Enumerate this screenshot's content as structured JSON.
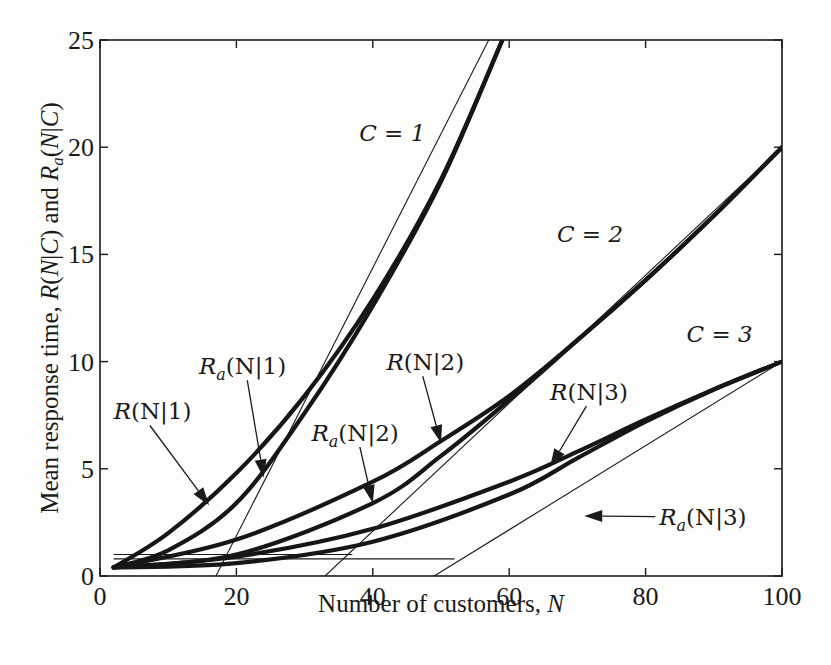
{
  "chart_data": {
    "type": "line",
    "title": "",
    "xlabel": "Number of customers, N",
    "ylabel": "Mean response time, R(N|C) and R_a(N|C)",
    "xlim": [
      0,
      100
    ],
    "ylim": [
      0,
      25
    ],
    "xticks": [
      0,
      20,
      40,
      60,
      80,
      100
    ],
    "yticks": [
      0,
      5,
      10,
      15,
      20,
      25
    ],
    "grid": false,
    "legend": "none (inline annotations)",
    "series": [
      {
        "name": "R(N|1)",
        "group": "C = 1",
        "x": [
          2,
          10,
          20,
          30,
          40,
          50,
          59
        ],
        "y": [
          0.4,
          2.0,
          4.8,
          8.4,
          12.9,
          18.5,
          25.0
        ]
      },
      {
        "name": "R_a(N|1)",
        "group": "C = 1",
        "x": [
          2,
          10,
          20,
          30,
          40,
          50,
          59
        ],
        "y": [
          0.4,
          1.2,
          3.4,
          7.6,
          12.6,
          18.4,
          25.0
        ]
      },
      {
        "name": "R(N|2)",
        "group": "C = 2",
        "x": [
          2,
          20,
          40,
          50,
          60,
          70,
          80,
          90,
          100
        ],
        "y": [
          0.4,
          1.7,
          4.4,
          6.3,
          8.4,
          11.0,
          13.8,
          16.8,
          20.0
        ]
      },
      {
        "name": "R_a(N|2)",
        "group": "C = 2",
        "x": [
          2,
          20,
          40,
          50,
          60,
          70,
          80,
          90,
          100
        ],
        "y": [
          0.4,
          1.0,
          3.4,
          5.6,
          8.2,
          11.0,
          13.8,
          16.8,
          20.0
        ]
      },
      {
        "name": "R(N|3)",
        "group": "C = 3",
        "x": [
          2,
          20,
          40,
          60,
          70,
          80,
          90,
          100
        ],
        "y": [
          0.4,
          0.9,
          2.2,
          4.4,
          5.8,
          7.3,
          8.7,
          10.0
        ]
      },
      {
        "name": "R_a(N|3)",
        "group": "C = 3",
        "x": [
          2,
          20,
          40,
          60,
          70,
          80,
          90,
          100
        ],
        "y": [
          0.4,
          0.6,
          1.6,
          3.8,
          5.5,
          7.2,
          8.7,
          10.0
        ]
      }
    ],
    "asymptotes": [
      {
        "name": "C=1 asymptote",
        "x": [
          17,
          57
        ],
        "y": [
          0,
          25
        ]
      },
      {
        "name": "C=2 asymptote",
        "x": [
          33,
          100
        ],
        "y": [
          0,
          20
        ]
      },
      {
        "name": "C=3 asymptote",
        "x": [
          49,
          100
        ],
        "y": [
          0,
          10
        ]
      }
    ],
    "baselines": [
      {
        "name": "C=2 lower bound",
        "x": [
          2,
          37
        ],
        "y": [
          1.0,
          1.0
        ]
      },
      {
        "name": "C=3 lower bound",
        "x": [
          2,
          52
        ],
        "y": [
          0.8,
          0.8
        ]
      }
    ],
    "annotations": [
      {
        "text": "C = 1",
        "x": 38,
        "y": 20.3
      },
      {
        "text": "C = 2",
        "x": 67,
        "y": 15.6
      },
      {
        "text": "C = 3",
        "x": 86,
        "y": 10.9
      },
      {
        "text": "R(N|1)",
        "x": 2,
        "y": 7.3,
        "arrow_to": [
          16,
          3.3
        ]
      },
      {
        "text": "R_a(N|1)",
        "x": 14.5,
        "y": 9.4,
        "arrow_to": [
          24,
          4.6
        ]
      },
      {
        "text": "R(N|2)",
        "x": 42,
        "y": 9.6,
        "arrow_to": [
          50,
          6.2
        ]
      },
      {
        "text": "R_a(N|2)",
        "x": 31,
        "y": 6.3,
        "arrow_to": [
          40,
          3.4
        ]
      },
      {
        "text": "R(N|3)",
        "x": 66,
        "y": 8.2,
        "arrow_to": [
          66,
          5.1
        ]
      },
      {
        "text": "R_a(N|3)",
        "x": 82,
        "y": 2.4,
        "arrow_to": [
          71,
          2.8
        ]
      }
    ]
  },
  "labels": {
    "xlabel": "Number of customers, ",
    "xlabel_var": "N",
    "ylabel_prefix": "Mean response time, "
  }
}
